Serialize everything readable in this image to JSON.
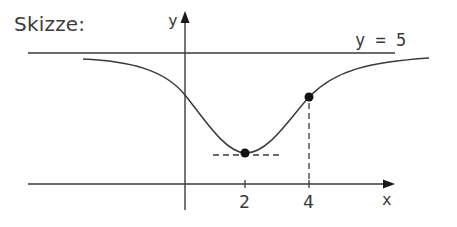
{
  "title": "Skizze:",
  "axes": {
    "x_label": "x",
    "y_label": "y",
    "x_ticks": [
      {
        "value": 2,
        "label": "2"
      },
      {
        "value": 4,
        "label": "4"
      }
    ]
  },
  "asymptote": {
    "label": "y = 5",
    "value": 5
  },
  "points": [
    {
      "name": "minimum",
      "x": 2,
      "description": "Tiefpunkt"
    },
    {
      "name": "point-at-4",
      "x": 4,
      "description": "Punkt bei x = 4"
    }
  ],
  "colors": {
    "line": "#3a3a3a",
    "text": "#3c3c3c",
    "background": "#ffffff"
  }
}
